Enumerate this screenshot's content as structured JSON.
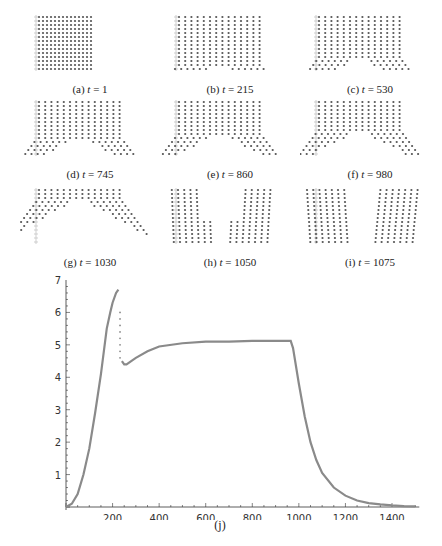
{
  "figure": {
    "panels": [
      {
        "id": "a",
        "label": "(a)",
        "t": "1",
        "gap": 0,
        "split": 0
      },
      {
        "id": "b",
        "label": "(b)",
        "t": "215",
        "gap": 1,
        "split": 0
      },
      {
        "id": "c",
        "label": "(c)",
        "t": "530",
        "gap": 2,
        "split": 0
      },
      {
        "id": "d",
        "label": "(d)",
        "t": "745",
        "gap": 3,
        "split": 0
      },
      {
        "id": "e",
        "label": "(e)",
        "t": "860",
        "gap": 3.5,
        "split": 0
      },
      {
        "id": "f",
        "label": "(f)",
        "t": "980",
        "gap": 4,
        "split": 0
      },
      {
        "id": "g",
        "label": "(g)",
        "t": "1030",
        "gap": 7,
        "split": 0
      },
      {
        "id": "h",
        "label": "(h)",
        "t": "1050",
        "gap": 0,
        "split": 1
      },
      {
        "id": "i",
        "label": "(i)",
        "t": "1075",
        "gap": 0,
        "split": 2
      }
    ],
    "chart_caption": "(j)"
  },
  "chart_data": {
    "type": "scatter",
    "title": "",
    "caption": "(j)",
    "xlabel": "",
    "ylabel": "",
    "xlim": [
      0,
      1500
    ],
    "ylim": [
      0,
      7
    ],
    "xticks": [
      200,
      400,
      600,
      800,
      1000,
      1200,
      1400
    ],
    "yticks": [
      1,
      2,
      3,
      4,
      5,
      6,
      7
    ],
    "grid": false,
    "color": "#8a8a8a",
    "x": [
      0,
      25,
      50,
      75,
      100,
      125,
      150,
      175,
      190,
      200,
      215,
      225,
      230,
      240,
      250,
      260,
      280,
      300,
      350,
      400,
      500,
      600,
      700,
      800,
      900,
      965,
      975,
      1000,
      1025,
      1050,
      1075,
      1100,
      1150,
      1200,
      1250,
      1300,
      1350,
      1400,
      1450,
      1500
    ],
    "y": [
      0,
      0.1,
      0.4,
      1.0,
      1.8,
      2.9,
      4.1,
      5.5,
      6.0,
      6.3,
      6.6,
      6.7,
      6.0,
      4.5,
      4.4,
      4.4,
      4.5,
      4.6,
      4.8,
      4.95,
      5.05,
      5.1,
      5.1,
      5.12,
      5.12,
      5.12,
      4.9,
      3.8,
      2.8,
      2.0,
      1.45,
      1.05,
      0.6,
      0.35,
      0.2,
      0.12,
      0.08,
      0.05,
      0.03,
      0.02
    ]
  }
}
